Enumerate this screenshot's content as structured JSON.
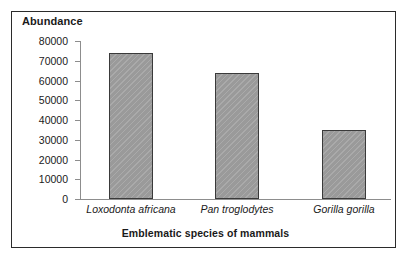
{
  "chart_data": {
    "type": "bar",
    "title": "",
    "xlabel": "Emblematic species of mammals",
    "ylabel": "Abundance",
    "categories": [
      "Loxodonta africana",
      "Pan troglodytes",
      "Gorilla gorilla"
    ],
    "values": [
      74000,
      64000,
      35000
    ],
    "ylim": [
      0,
      80000
    ],
    "ytick_step": 10000,
    "yticks": [
      80000,
      70000,
      60000,
      50000,
      40000,
      30000,
      20000,
      10000,
      0
    ],
    "ytick_labels": [
      "80000",
      "70000",
      "60000",
      "50000",
      "40000",
      "30000",
      "20000",
      "10000",
      "0"
    ],
    "grid": false,
    "legend": false,
    "legend_position": "none",
    "series": [
      {
        "name": "Abundance",
        "values": [
          74000,
          64000,
          35000
        ]
      }
    ],
    "colors": {
      "bar_fill": "#9a9a9a",
      "bar_border": "#3a3a3a",
      "axis": "#8d8d8d",
      "text": "#1a1a1a",
      "frame_border": "#2b2b2b",
      "background": "#ffffff"
    }
  }
}
